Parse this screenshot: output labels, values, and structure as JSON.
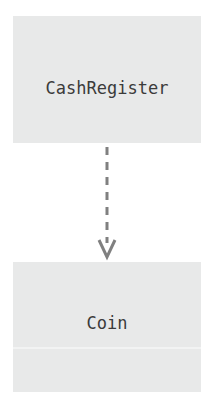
{
  "diagram": {
    "type": "uml-class-diagram",
    "background_color": "#ffffff",
    "box_fill_color": "#e8e9e9",
    "text_color": "#3b3b3b",
    "connector_color": "#808080",
    "classes": [
      {
        "id": "cashregister",
        "name": "CashRegister",
        "position": {
          "x": 13,
          "y": 16,
          "width": 188,
          "height": 127
        },
        "compartments": 1
      },
      {
        "id": "coin",
        "name": "Coin",
        "position": {
          "x": 13,
          "y": 262,
          "width": 188,
          "height": 130
        },
        "compartments": 2
      }
    ],
    "relationships": [
      {
        "id": "cashregister-depends-on-coin",
        "type": "dependency",
        "line_style": "dashed",
        "arrowhead": "open",
        "source": "CashRegister",
        "target": "Coin",
        "label": ""
      }
    ]
  }
}
